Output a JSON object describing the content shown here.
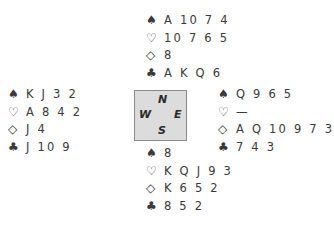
{
  "suits": {
    "spades": "♠",
    "hearts": "♡",
    "diamonds": "◇",
    "clubs": "♣"
  },
  "compass": {
    "n": "N",
    "w": "W",
    "e": "E",
    "s": "S"
  },
  "hands": {
    "north": {
      "spades": "A 10 7 4",
      "hearts": "10 7 6 5",
      "diamonds": "8",
      "clubs": "A K Q 6"
    },
    "west": {
      "spades": "K J 3 2",
      "hearts": "A 8 4 2",
      "diamonds": "J 4",
      "clubs": "J 10 9"
    },
    "east": {
      "spades": "Q 9 6 5",
      "hearts": "—",
      "diamonds": "A Q 10 9 7 3",
      "clubs": "7 4 3"
    },
    "south": {
      "spades": "8",
      "hearts": "K Q J 9 3",
      "diamonds": "K 6 5 2",
      "clubs": "8 5 2"
    }
  }
}
